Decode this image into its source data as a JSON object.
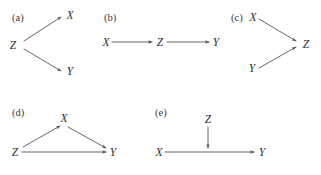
{
  "figure": {
    "width": 321,
    "height": 175,
    "background": "#ffffff",
    "line_color": "#56565c",
    "text_color": "#2e2e2e",
    "label_color": "#3a3a3a"
  },
  "panels": [
    {
      "id": "a",
      "label": "(a)",
      "structure": "fork",
      "nodes": [
        {
          "name": "Z",
          "text": "Z"
        },
        {
          "name": "X",
          "text": "X"
        },
        {
          "name": "Y",
          "text": "Y"
        }
      ],
      "edges": [
        {
          "from": "Z",
          "to": "X"
        },
        {
          "from": "Z",
          "to": "Y"
        }
      ]
    },
    {
      "id": "b",
      "label": "(b)",
      "structure": "chain",
      "nodes": [
        {
          "name": "X",
          "text": "X"
        },
        {
          "name": "Z",
          "text": "Z"
        },
        {
          "name": "Y",
          "text": "Y"
        }
      ],
      "edges": [
        {
          "from": "X",
          "to": "Z"
        },
        {
          "from": "Z",
          "to": "Y"
        }
      ]
    },
    {
      "id": "c",
      "label": "(c)",
      "structure": "collider",
      "nodes": [
        {
          "name": "X",
          "text": "X"
        },
        {
          "name": "Y",
          "text": "Y"
        },
        {
          "name": "Z",
          "text": "Z"
        }
      ],
      "edges": [
        {
          "from": "X",
          "to": "Z"
        },
        {
          "from": "Y",
          "to": "Z"
        }
      ]
    },
    {
      "id": "d",
      "label": "(d)",
      "structure": "triangle",
      "nodes": [
        {
          "name": "Z",
          "text": "Z"
        },
        {
          "name": "X",
          "text": "X"
        },
        {
          "name": "Y",
          "text": "Y"
        }
      ],
      "edges": [
        {
          "from": "Z",
          "to": "X"
        },
        {
          "from": "X",
          "to": "Y"
        },
        {
          "from": "Z",
          "to": "Y"
        }
      ]
    },
    {
      "id": "e",
      "label": "(e)",
      "structure": "edge-intervention",
      "nodes": [
        {
          "name": "Z",
          "text": "Z"
        },
        {
          "name": "X",
          "text": "X"
        },
        {
          "name": "Y",
          "text": "Y"
        }
      ],
      "edges": [
        {
          "from": "X",
          "to": "Y"
        },
        {
          "from": "Z",
          "to": "XY-edge-midpoint"
        }
      ]
    }
  ]
}
